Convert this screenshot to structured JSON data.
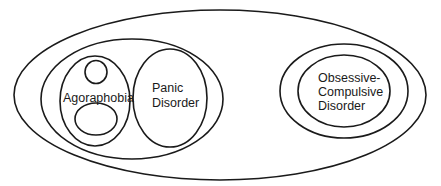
{
  "diagram": {
    "type": "nested-ellipses",
    "stroke_color": "#1a1a1a",
    "background": "#ffffff",
    "labels": {
      "agoraphobia": "Agoraphobia",
      "panic_line1": "Panic",
      "panic_line2": "Disorder",
      "ocd_line1": "Obsessive-",
      "ocd_line2": "Compulsive",
      "ocd_line3": "Disorder"
    }
  }
}
